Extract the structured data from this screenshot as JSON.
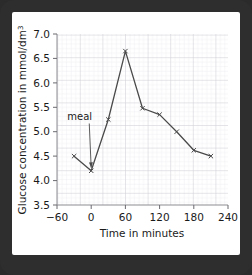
{
  "page": {
    "background": "#ffffff",
    "frame_color": "#2f2e2e"
  },
  "chart_data": {
    "type": "line",
    "title": "",
    "xlabel": "Time in minutes",
    "ylabel": "Glucose concentration in mmol/dm³",
    "ylabel_main": "Glucose concentration in mmol/dm",
    "ylabel_sup": "3",
    "x": [
      -30,
      0,
      30,
      60,
      90,
      120,
      150,
      180,
      210
    ],
    "values": [
      4.5,
      4.2,
      5.25,
      6.65,
      5.48,
      5.35,
      5.0,
      4.62,
      4.5
    ],
    "series": [
      {
        "name": "Blood glucose concentration",
        "values": [
          4.5,
          4.2,
          5.25,
          6.65,
          5.48,
          5.35,
          5.0,
          4.62,
          4.5
        ]
      }
    ],
    "xlim": [
      -60,
      240
    ],
    "ylim": [
      3.5,
      7.0
    ],
    "xticks": [
      -60,
      0,
      60,
      120,
      180,
      240
    ],
    "xtick_labels": [
      "−60",
      "0",
      "60",
      "120",
      "180",
      "240"
    ],
    "yticks": [
      3.5,
      4.0,
      4.5,
      5.0,
      5.5,
      6.0,
      6.5,
      7.0
    ],
    "ytick_labels": [
      "3.5",
      "4.0",
      "4.5",
      "5.0",
      "5.5",
      "6.0",
      "6.5",
      "7.0"
    ],
    "grid": true,
    "grid_minor_step_x": 6,
    "grid_minor_step_y": 0.07,
    "legend": "none",
    "line_color": "#4a4a4a",
    "marker": "x",
    "annotations": [
      {
        "text": "meal",
        "points_to_x": 0,
        "points_to_y": 4.2,
        "label_x": -42,
        "label_y": 5.25
      }
    ]
  }
}
